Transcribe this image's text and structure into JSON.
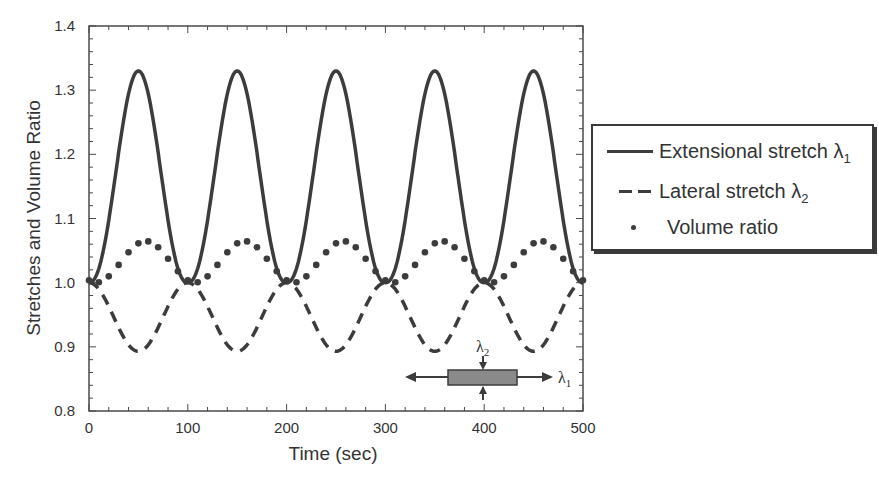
{
  "chart_data": {
    "type": "line",
    "title": "",
    "xlabel": "Time (sec)",
    "ylabel": "Stretches and Volume Ratio",
    "xlim": [
      0,
      500
    ],
    "ylim": [
      0.8,
      1.4
    ],
    "x_ticks": [
      "0",
      "100",
      "200",
      "300",
      "400",
      "500"
    ],
    "y_ticks": [
      "0.8",
      "0.9",
      "1.0",
      "1.1",
      "1.2",
      "1.3",
      "1.4"
    ],
    "grid": false,
    "legend_position": "right, outside plot",
    "x": [
      0,
      10,
      20,
      30,
      40,
      50,
      60,
      70,
      80,
      90,
      100,
      110,
      120,
      130,
      140,
      150,
      160,
      170,
      180,
      190,
      200,
      210,
      220,
      230,
      240,
      250,
      260,
      270,
      280,
      290,
      300,
      310,
      320,
      330,
      340,
      350,
      360,
      370,
      380,
      390,
      400,
      410,
      420,
      430,
      440,
      450,
      460,
      470,
      480,
      490,
      500
    ],
    "series": [
      {
        "name": "Extensional stretch λ1",
        "style": "solid",
        "values": [
          1.0,
          1.03,
          1.12,
          1.23,
          1.31,
          1.33,
          1.31,
          1.23,
          1.12,
          1.03,
          1.0,
          1.03,
          1.12,
          1.23,
          1.31,
          1.33,
          1.31,
          1.23,
          1.12,
          1.03,
          1.0,
          1.03,
          1.12,
          1.23,
          1.31,
          1.33,
          1.31,
          1.23,
          1.12,
          1.03,
          1.0,
          1.03,
          1.12,
          1.23,
          1.31,
          1.33,
          1.31,
          1.23,
          1.12,
          1.03,
          1.0,
          1.03,
          1.12,
          1.23,
          1.31,
          1.33,
          1.31,
          1.23,
          1.12,
          1.03,
          1.0
        ]
      },
      {
        "name": "Lateral stretch λ2",
        "style": "dashed",
        "values": [
          1.0,
          0.99,
          0.96,
          0.93,
          0.9,
          0.893,
          0.9,
          0.93,
          0.96,
          0.99,
          1.0,
          0.99,
          0.96,
          0.93,
          0.9,
          0.893,
          0.9,
          0.93,
          0.96,
          0.99,
          1.0,
          0.99,
          0.96,
          0.93,
          0.9,
          0.893,
          0.9,
          0.93,
          0.96,
          0.99,
          1.0,
          0.99,
          0.96,
          0.93,
          0.9,
          0.893,
          0.9,
          0.93,
          0.96,
          0.99,
          1.0,
          0.99,
          0.96,
          0.93,
          0.9,
          0.893,
          0.9,
          0.93,
          0.96,
          0.99,
          1.0
        ]
      },
      {
        "name": "Volume ratio",
        "style": "dotted",
        "values": [
          1.0,
          1.01,
          1.03,
          1.05,
          1.06,
          1.065,
          1.065,
          1.06,
          1.04,
          1.02,
          1.005,
          1.01,
          1.03,
          1.05,
          1.06,
          1.065,
          1.065,
          1.06,
          1.04,
          1.02,
          1.005,
          1.01,
          1.03,
          1.05,
          1.06,
          1.065,
          1.065,
          1.06,
          1.04,
          1.02,
          1.005,
          1.01,
          1.03,
          1.05,
          1.06,
          1.065,
          1.065,
          1.06,
          1.04,
          1.02,
          1.005,
          1.01,
          1.03,
          1.05,
          1.06,
          1.065,
          1.065,
          1.06,
          1.04,
          1.02,
          1.005
        ]
      }
    ],
    "annotations": [
      {
        "text": "λ2",
        "description": "vertical compression arrows on inset specimen"
      },
      {
        "text": "λ1",
        "description": "horizontal extension arrows on inset specimen"
      }
    ]
  },
  "axes": {
    "xlabel": "Time (sec)",
    "ylabel": "Stretches and Volume Ratio",
    "x_ticks": [
      "0",
      "100",
      "200",
      "300",
      "400",
      "500"
    ],
    "y_ticks": [
      "0.8",
      "0.9",
      "1.0",
      "1.1",
      "1.2",
      "1.3",
      "1.4"
    ]
  },
  "legend": {
    "items": [
      {
        "label": "Extensional stretch λ",
        "sub": "1"
      },
      {
        "label": "Lateral stretch λ",
        "sub": "2"
      },
      {
        "label": "Volume ratio",
        "sub": ""
      }
    ]
  },
  "inset": {
    "lambda1_label": "λ",
    "lambda1_sub": "1",
    "lambda2_label": "λ",
    "lambda2_sub": "2"
  },
  "colors": {
    "line": "#3c3c3c",
    "axis": "#4a4a4a",
    "specimen_fill": "#8a8a8a"
  }
}
